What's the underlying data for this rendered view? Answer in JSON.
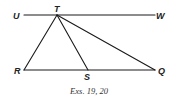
{
  "figure": {
    "caption": "Exs. 19, 20",
    "stroke_color": "#1a1a1a",
    "points": {
      "U": {
        "label": "U",
        "x": 24,
        "y": 15
      },
      "T": {
        "label": "T",
        "x": 57,
        "y": 15
      },
      "W": {
        "label": "W",
        "x": 155,
        "y": 15
      },
      "R": {
        "label": "R",
        "x": 24,
        "y": 70
      },
      "S": {
        "label": "S",
        "x": 88,
        "y": 70
      },
      "Q": {
        "label": "Q",
        "x": 155,
        "y": 70
      }
    },
    "segments": [
      {
        "name": "line-UW",
        "from": "U",
        "to": "W"
      },
      {
        "name": "segment-RQ",
        "from": "R",
        "to": "Q"
      },
      {
        "name": "segment-TR",
        "from": "T",
        "to": "R"
      },
      {
        "name": "segment-TS",
        "from": "T",
        "to": "S"
      },
      {
        "name": "segment-TQ",
        "from": "T",
        "to": "Q"
      }
    ]
  }
}
